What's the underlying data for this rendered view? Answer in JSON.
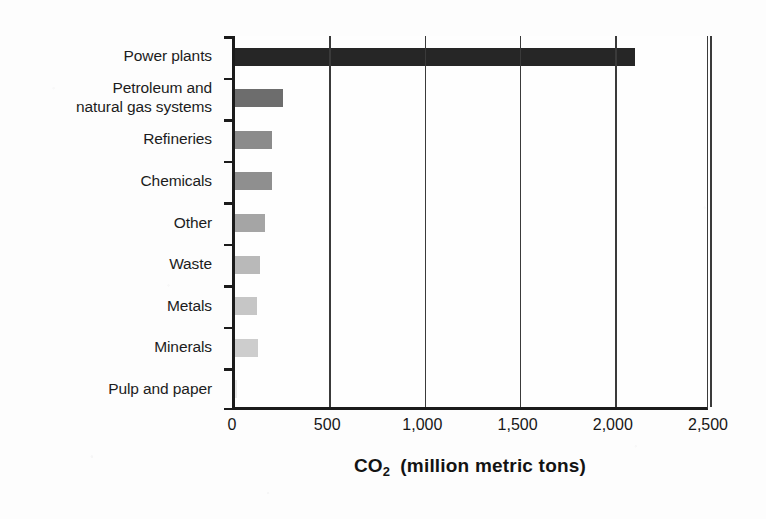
{
  "chart_data": {
    "type": "bar",
    "orientation": "horizontal",
    "title": "",
    "xlabel": "CO2  (million metric tons)",
    "xlabel_parts": {
      "formula_main": "CO",
      "formula_sub": "2",
      "units": "(million metric tons)"
    },
    "ylabel": "",
    "xlim": [
      0,
      2500
    ],
    "xticks": [
      0,
      500,
      1000,
      1500,
      2000,
      2500
    ],
    "xtick_labels": [
      "0",
      "500",
      "1,000",
      "1,500",
      "2,000",
      "2,500"
    ],
    "grid": "vertical gridlines at each x tick",
    "legend": "none",
    "categories": [
      "Power plants",
      "Petroleum and\nnatural gas systems",
      "Refineries",
      "Chemicals",
      "Other",
      "Waste",
      "Metals",
      "Minerals",
      "Pulp and paper"
    ],
    "values": [
      2100,
      250,
      195,
      195,
      155,
      130,
      115,
      120,
      12
    ],
    "bar_colors": [
      "#262626",
      "#6d6d6d",
      "#8b8b8b",
      "#8f8f8f",
      "#a5a5a5",
      "#b9b9b9",
      "#c6c6c6",
      "#cdcdcd",
      "#e8e8e8"
    ],
    "series": [
      {
        "name": "CO2 emissions",
        "values": [
          2100,
          250,
          195,
          195,
          155,
          130,
          115,
          120,
          12
        ]
      }
    ]
  },
  "colors": {
    "page_background": "#fdfdfd",
    "axis": "#1b1b1b",
    "gridline": "#3a3a3a",
    "text": "#1a1a1a"
  }
}
